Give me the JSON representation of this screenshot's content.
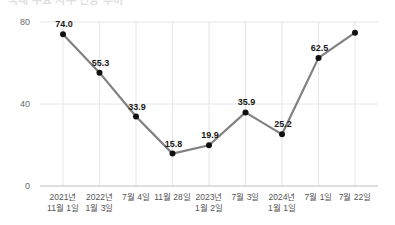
{
  "title": {
    "text": "국내 주요 지수 변동 추이",
    "clipped": true
  },
  "chart_data": {
    "type": "line",
    "title": "국내 주요 지수 변동 추이",
    "xlabel": "",
    "ylabel": "",
    "grid": true,
    "legend": "none",
    "ylim": [
      0,
      80
    ],
    "yticks": [
      "0",
      "40",
      "80"
    ],
    "ytick_values": [
      0,
      40,
      80
    ],
    "categories": [
      "2021년\n11월 1일",
      "2022년\n1월 3일",
      "7월 4일",
      "11월 28일",
      "2023년\n1월 2일",
      "7월 3일",
      "2024년\n1월 1일",
      "7월 1일",
      "7월 22일"
    ],
    "category_lines": [
      [
        "2021년",
        "11월 1일"
      ],
      [
        "2022년",
        "1월 3일"
      ],
      [
        "7월 4일",
        ""
      ],
      [
        "11월 28일",
        ""
      ],
      [
        "2023년",
        "1월 2일"
      ],
      [
        "7월 3일",
        ""
      ],
      [
        "2024년",
        "1월 1일"
      ],
      [
        "7월 1일",
        ""
      ],
      [
        "7월 22일",
        ""
      ]
    ],
    "values": [
      74.0,
      55.3,
      33.9,
      15.8,
      19.9,
      35.9,
      25.2,
      62.5,
      74.8
    ],
    "point_labels": [
      "74.0",
      "55.3",
      "33.9",
      "15.8",
      "19.9",
      "35.9",
      "25.2",
      "62.5",
      ""
    ],
    "colors": {
      "line": "#808080",
      "marker": "#101010",
      "grid": "#e6e6ea",
      "axis": "#bdbdbd",
      "label": "#1a1a1a",
      "tick": "#555555"
    }
  }
}
